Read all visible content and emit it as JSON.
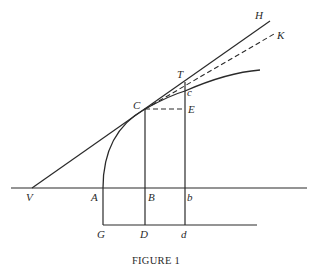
{
  "figure": {
    "caption": "FIGURE 1",
    "labels": {
      "H": "H",
      "K": "K",
      "T": "T",
      "c": "c",
      "C": "C",
      "E": "E",
      "V": "V",
      "A": "A",
      "B": "B",
      "b": "b",
      "G": "G",
      "D": "D",
      "d": "d"
    },
    "elements": {
      "tangent_line": "V to H (solid)",
      "secant_line": "C to K (dashed)",
      "curve": "A through C and c",
      "horizontal_axis": "through V, A, B, b",
      "baseline": "G, D, d",
      "ordinates": [
        "CB to D",
        "Tc to b to d"
      ],
      "increment": "C to E (dashed)"
    }
  }
}
